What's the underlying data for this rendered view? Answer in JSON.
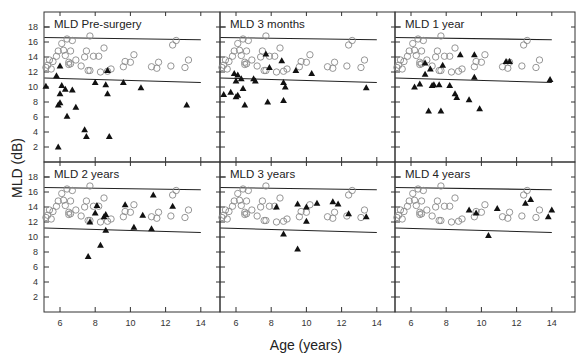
{
  "chart_data": {
    "type": "scatter",
    "layout": "2x3 small multiples, shared axes",
    "xlabel": "Age (years)",
    "ylabel": "MLD (dB)",
    "xlim": [
      5,
      15
    ],
    "ylim": [
      0,
      19.5
    ],
    "xticks": [
      6,
      8,
      10,
      12,
      14
    ],
    "yticks": [
      2,
      4,
      6,
      8,
      10,
      12,
      14,
      16,
      18
    ],
    "grid": false,
    "legend": "none",
    "series_styles": {
      "normal": {
        "marker": "open-circle",
        "color": "#888888"
      },
      "patients": {
        "marker": "filled-triangle",
        "color": "#111111"
      }
    },
    "normal_range_lines": {
      "upper": {
        "x": [
          5,
          14
        ],
        "y": [
          16.6,
          16.3
        ]
      },
      "lower": {
        "x": [
          5,
          14
        ],
        "y": [
          11.2,
          10.6
        ]
      }
    },
    "normal_points": [
      [
        5.2,
        12.6
      ],
      [
        5.3,
        12.9
      ],
      [
        5.4,
        13.6
      ],
      [
        5.5,
        12.4
      ],
      [
        5.6,
        13.4
      ],
      [
        5.8,
        14.1
      ],
      [
        5.9,
        14.8
      ],
      [
        6.1,
        15.8
      ],
      [
        6.2,
        14.9
      ],
      [
        6.3,
        14.2
      ],
      [
        6.4,
        16.4
      ],
      [
        6.5,
        13.3
      ],
      [
        6.6,
        14.8
      ],
      [
        6.7,
        16.2
      ],
      [
        6.5,
        13.0
      ],
      [
        6.6,
        13.1
      ],
      [
        6.9,
        13.6
      ],
      [
        7.2,
        12.8
      ],
      [
        7.4,
        14.0
      ],
      [
        7.5,
        14.8
      ],
      [
        7.6,
        12.2
      ],
      [
        7.7,
        16.8
      ],
      [
        7.7,
        12.2
      ],
      [
        7.9,
        14.1
      ],
      [
        8.2,
        14.1
      ],
      [
        8.3,
        12.0
      ],
      [
        8.5,
        15.2
      ],
      [
        8.7,
        12.1
      ],
      [
        8.9,
        12.4
      ],
      [
        9.6,
        12.7
      ],
      [
        9.7,
        13.4
      ],
      [
        10.0,
        13.3
      ],
      [
        10.2,
        14.3
      ],
      [
        11.2,
        12.7
      ],
      [
        11.5,
        12.5
      ],
      [
        11.6,
        13.3
      ],
      [
        12.3,
        12.8
      ],
      [
        12.4,
        15.6
      ],
      [
        12.6,
        16.2
      ],
      [
        13.1,
        12.6
      ],
      [
        13.3,
        13.6
      ]
    ],
    "panels": [
      {
        "title": "MLD Pre-surgery",
        "patients": [
          [
            5.2,
            10.1
          ],
          [
            5.9,
            2.0
          ],
          [
            6.0,
            12.8
          ],
          [
            5.8,
            11.5
          ],
          [
            6.1,
            10.2
          ],
          [
            6.0,
            9.1
          ],
          [
            5.9,
            7.6
          ],
          [
            6.0,
            7.9
          ],
          [
            6.3,
            9.7
          ],
          [
            6.4,
            6.1
          ],
          [
            6.7,
            9.6
          ],
          [
            6.9,
            7.3
          ],
          [
            7.4,
            4.3
          ],
          [
            7.5,
            3.4
          ],
          [
            8.0,
            10.6
          ],
          [
            8.6,
            10.3
          ],
          [
            8.7,
            9.1
          ],
          [
            8.7,
            12.2
          ],
          [
            8.8,
            3.4
          ],
          [
            9.6,
            10.6
          ],
          [
            10.6,
            9.9
          ],
          [
            13.2,
            7.6
          ]
        ]
      },
      {
        "title": "MLD 3 months",
        "patients": [
          [
            5.3,
            9.0
          ],
          [
            5.7,
            9.3
          ],
          [
            5.9,
            11.8
          ],
          [
            6.0,
            10.8
          ],
          [
            6.1,
            11.6
          ],
          [
            6.0,
            8.7
          ],
          [
            6.1,
            8.9
          ],
          [
            6.3,
            11.1
          ],
          [
            6.4,
            9.8
          ],
          [
            6.5,
            7.6
          ],
          [
            7.0,
            11.1
          ],
          [
            7.1,
            10.8
          ],
          [
            7.7,
            14.4
          ],
          [
            7.8,
            8.0
          ],
          [
            7.9,
            12.6
          ],
          [
            8.6,
            13.5
          ],
          [
            8.7,
            10.6
          ],
          [
            8.8,
            10.0
          ],
          [
            8.7,
            8.2
          ],
          [
            9.4,
            12.2
          ],
          [
            10.3,
            11.8
          ],
          [
            13.4,
            9.9
          ]
        ]
      },
      {
        "title": "MLD 1 year",
        "patients": [
          [
            6.2,
            10.0
          ],
          [
            6.5,
            10.4
          ],
          [
            6.8,
            13.2
          ],
          [
            6.8,
            11.7
          ],
          [
            7.1,
            12.4
          ],
          [
            7.0,
            6.8
          ],
          [
            7.2,
            10.2
          ],
          [
            7.3,
            10.3
          ],
          [
            7.6,
            10.3
          ],
          [
            7.7,
            6.8
          ],
          [
            7.8,
            12.9
          ],
          [
            8.2,
            10.2
          ],
          [
            8.5,
            9.1
          ],
          [
            8.6,
            8.6
          ],
          [
            8.8,
            14.3
          ],
          [
            9.3,
            8.3
          ],
          [
            9.6,
            14.3
          ],
          [
            9.6,
            11.3
          ],
          [
            9.9,
            7.1
          ],
          [
            11.4,
            13.4
          ],
          [
            11.6,
            13.4
          ],
          [
            13.9,
            11.0
          ]
        ]
      },
      {
        "title": "MLD 2 years",
        "patients": [
          [
            7.6,
            7.4
          ],
          [
            7.7,
            12.0
          ],
          [
            8.0,
            13.2
          ],
          [
            8.1,
            14.2
          ],
          [
            8.3,
            8.9
          ],
          [
            8.5,
            12.7
          ],
          [
            8.6,
            13.0
          ],
          [
            8.6,
            10.9
          ],
          [
            9.7,
            14.3
          ],
          [
            10.2,
            11.3
          ],
          [
            10.7,
            12.9
          ],
          [
            11.2,
            11.1
          ],
          [
            11.3,
            15.6
          ],
          [
            12.4,
            14.1
          ]
        ]
      },
      {
        "title": "MLD 3 years",
        "patients": [
          [
            8.3,
            14.0
          ],
          [
            8.7,
            10.4
          ],
          [
            9.5,
            8.4
          ],
          [
            9.5,
            14.4
          ],
          [
            10.0,
            12.1
          ],
          [
            10.0,
            14.0
          ],
          [
            10.6,
            14.5
          ],
          [
            11.5,
            14.7
          ],
          [
            11.8,
            14.4
          ],
          [
            12.4,
            13.1
          ],
          [
            13.4,
            12.7
          ]
        ]
      },
      {
        "title": "MLD 4 years",
        "patients": [
          [
            9.3,
            13.6
          ],
          [
            9.7,
            13.2
          ],
          [
            10.4,
            10.2
          ],
          [
            10.9,
            13.8
          ],
          [
            12.5,
            14.5
          ],
          [
            12.8,
            15.0
          ],
          [
            13.8,
            12.7
          ],
          [
            14.0,
            13.6
          ]
        ]
      }
    ]
  },
  "labels": {
    "xlabel": "Age (years)",
    "ylabel": "MLD (dB)",
    "panel_titles": [
      "MLD Pre-surgery",
      "MLD 3 months",
      "MLD 1 year",
      "MLD 2 years",
      "MLD 3 years",
      "MLD 4 years"
    ]
  }
}
